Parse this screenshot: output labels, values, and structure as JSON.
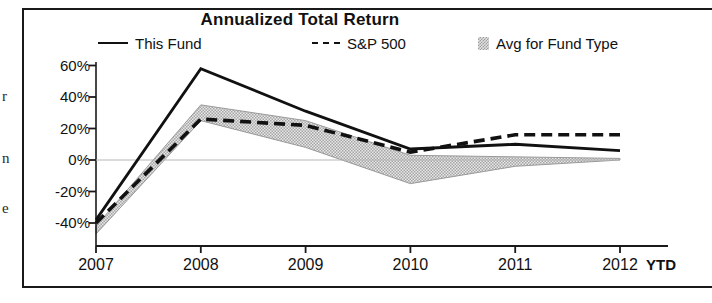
{
  "title": "Annualized Total Return",
  "legend": [
    {
      "label": "This Fund",
      "marker": "solid-line-icon"
    },
    {
      "label": "S&P 500",
      "marker": "dashed-line-icon"
    },
    {
      "label": "Avg for Fund Type",
      "marker": "shaded-swatch-icon"
    }
  ],
  "axis": {
    "y_ticks": [
      "60%",
      "40%",
      "20%",
      "0%",
      "-20%",
      "-40%"
    ],
    "x_ticks": [
      "2007",
      "2008",
      "2009",
      "2010",
      "2011",
      "2012"
    ],
    "x_suffix": "YTD"
  },
  "left_edge_artifacts": [
    "r",
    "n",
    "e"
  ],
  "colors": {
    "line": "#111111",
    "band_fill": "#d2d2d2",
    "band_edge": "#9a9a9a",
    "axis": "#1a1a1a",
    "frame": "#1a1a1a"
  },
  "chart_data": {
    "type": "line",
    "title": "Annualized Total Return",
    "xlabel": "",
    "ylabel": "",
    "ylim": [
      -50,
      65
    ],
    "yticks": [
      -40,
      -20,
      0,
      20,
      40,
      60
    ],
    "ytick_format": "percent",
    "grid": false,
    "legend_position": "top",
    "categories": [
      "2007",
      "2008",
      "2009",
      "2010",
      "2011",
      "2012 YTD"
    ],
    "series": [
      {
        "name": "This Fund",
        "style": "solid",
        "values": [
          -38,
          58,
          31,
          7,
          10,
          6
        ]
      },
      {
        "name": "S&P 500",
        "style": "dashed",
        "values": [
          -40,
          26,
          22,
          5,
          16,
          16
        ]
      },
      {
        "name": "Avg for Fund Type",
        "style": "band",
        "upper": [
          -42,
          35,
          25,
          3,
          2,
          1
        ],
        "lower": [
          -47,
          25,
          8,
          -15,
          -4,
          0
        ]
      }
    ]
  }
}
